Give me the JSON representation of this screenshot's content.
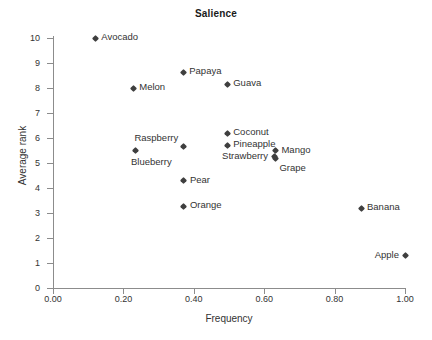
{
  "chart_data": {
    "type": "scatter",
    "title": "Salience",
    "xlabel": "Frequency",
    "ylabel": "Average rank",
    "xlim": [
      0.0,
      1.0
    ],
    "ylim": [
      0,
      10
    ],
    "xticks": [
      "0.00",
      "0.20",
      "0.40",
      "0.60",
      "0.80",
      "1.00"
    ],
    "xtick_values": [
      0.0,
      0.2,
      0.4,
      0.6,
      0.8,
      1.0
    ],
    "yticks": [
      "0",
      "1",
      "2",
      "3",
      "4",
      "5",
      "6",
      "7",
      "8",
      "9",
      "10"
    ],
    "ytick_values": [
      0,
      1,
      2,
      3,
      4,
      5,
      6,
      7,
      8,
      9,
      10
    ],
    "grid": false,
    "legend": null,
    "marker": "diamond",
    "marker_color": "#3f3f3f",
    "points": [
      {
        "label": "Avocado",
        "x": 0.12,
        "y": 10.0,
        "label_pos": "right"
      },
      {
        "label": "Papaya",
        "x": 0.37,
        "y": 8.63,
        "label_pos": "right"
      },
      {
        "label": "Guava",
        "x": 0.495,
        "y": 8.15,
        "label_pos": "right"
      },
      {
        "label": "Melon",
        "x": 0.228,
        "y": 8.0,
        "label_pos": "right"
      },
      {
        "label": "Coconut",
        "x": 0.495,
        "y": 6.2,
        "label_pos": "right"
      },
      {
        "label": "Pineapple",
        "x": 0.495,
        "y": 5.72,
        "label_pos": "right"
      },
      {
        "label": "Raspberry",
        "x": 0.37,
        "y": 5.65,
        "label_pos": "above-left"
      },
      {
        "label": "Blueberry",
        "x": 0.233,
        "y": 5.5,
        "label_pos": "below"
      },
      {
        "label": "Mango",
        "x": 0.632,
        "y": 5.5,
        "label_pos": "right"
      },
      {
        "label": "Strawberry",
        "x": 0.628,
        "y": 5.25,
        "label_pos": "left"
      },
      {
        "label": "Grape",
        "x": 0.632,
        "y": 5.2,
        "label_pos": "below-right"
      },
      {
        "label": "Pear",
        "x": 0.372,
        "y": 4.3,
        "label_pos": "right"
      },
      {
        "label": "Orange",
        "x": 0.372,
        "y": 3.28,
        "label_pos": "right"
      },
      {
        "label": "Banana",
        "x": 0.875,
        "y": 3.2,
        "label_pos": "right"
      },
      {
        "label": "Apple",
        "x": 1.0,
        "y": 1.3,
        "label_pos": "left"
      }
    ]
  }
}
